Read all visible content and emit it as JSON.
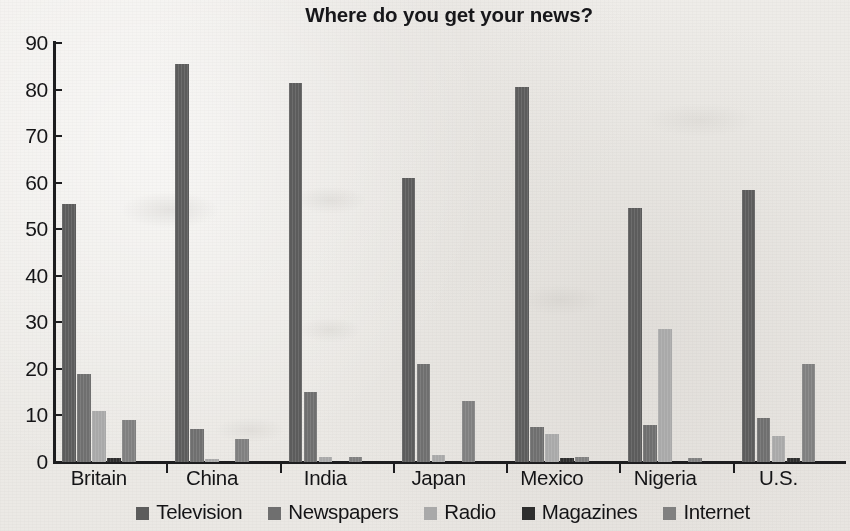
{
  "chart_data": {
    "type": "bar",
    "title": "Where do you get your news?",
    "xlabel": "",
    "ylabel": "",
    "ylim": [
      0,
      90
    ],
    "yticks": [
      0,
      10,
      20,
      30,
      40,
      50,
      60,
      70,
      80,
      90
    ],
    "ytick_labels": [
      "0",
      "10",
      "20",
      "30",
      "40",
      "50",
      "60",
      "70",
      "80",
      "90"
    ],
    "grid": false,
    "legend_position": "bottom",
    "categories": [
      "Britain",
      "China",
      "India",
      "Japan",
      "Mexico",
      "Nigeria",
      "U.S."
    ],
    "series": [
      {
        "name": "Television",
        "color": "#5c5c5c",
        "values": [
          55.5,
          85.5,
          81.5,
          61,
          80.5,
          54.5,
          58.5
        ]
      },
      {
        "name": "Newspapers",
        "color": "#6f6f6f",
        "values": [
          19,
          7,
          15,
          21,
          7.5,
          8,
          9.5
        ]
      },
      {
        "name": "Radio",
        "color": "#a9a9a9",
        "values": [
          11,
          0.6,
          1,
          1.5,
          6,
          28.5,
          5.5
        ]
      },
      {
        "name": "Magazines",
        "color": "#2e2e2e",
        "values": [
          0.8,
          0,
          0,
          0,
          0.8,
          0,
          0.9
        ]
      },
      {
        "name": "Internet",
        "color": "#808080",
        "values": [
          9,
          5,
          1,
          13,
          1,
          0.9,
          21
        ]
      }
    ]
  },
  "legend": {
    "items": [
      {
        "label": "Television",
        "swatch": "legend-swatch-television"
      },
      {
        "label": "Newspapers",
        "swatch": "legend-swatch-newspapers"
      },
      {
        "label": "Radio",
        "swatch": "legend-swatch-radio"
      },
      {
        "label": "Magazines",
        "swatch": "legend-swatch-magazines"
      },
      {
        "label": "Internet",
        "swatch": "legend-swatch-internet"
      }
    ]
  }
}
